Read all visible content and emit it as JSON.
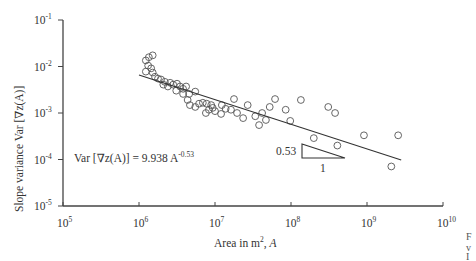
{
  "chart_data": {
    "type": "scatter",
    "title": "",
    "xlabel": "Area in m², A",
    "xlabel_parts": {
      "text": "Area in m",
      "sup": "2",
      "suffix": ", ",
      "var": "A"
    },
    "ylabel": "Slope variance Var [∇z(A)]",
    "xscale": "log",
    "yscale": "log",
    "xlim": [
      100000,
      10000000000
    ],
    "ylim": [
      1e-05,
      0.1
    ],
    "x_ticks": [
      {
        "base": "10",
        "exp": "5",
        "log": 5
      },
      {
        "base": "10",
        "exp": "6",
        "log": 6
      },
      {
        "base": "10",
        "exp": "7",
        "log": 7
      },
      {
        "base": "10",
        "exp": "8",
        "log": 8
      },
      {
        "base": "10",
        "exp": "9",
        "log": 9
      },
      {
        "base": "10",
        "exp": "10",
        "log": 10
      }
    ],
    "y_ticks": [
      {
        "base": "10",
        "exp": "-1",
        "log": -1
      },
      {
        "base": "10",
        "exp": "-2",
        "log": -2
      },
      {
        "base": "10",
        "exp": "-3",
        "log": -3
      },
      {
        "base": "10",
        "exp": "-4",
        "log": -4
      },
      {
        "base": "10",
        "exp": "-5",
        "log": -5
      }
    ],
    "grid": false,
    "legend": null,
    "fit": {
      "equation_text": "Var [∇z(A)] = 9.938 A",
      "equation_exp": "-0.53",
      "coefficient": 9.938,
      "exponent": -0.53,
      "log_x_range": [
        6.0,
        9.45
      ]
    },
    "slope_triangle": {
      "rise_label": "0.53",
      "run_label": "1"
    },
    "series": [
      {
        "name": "observations",
        "marker": "open-circle",
        "points_log10": [
          [
            6.09,
            -1.87
          ],
          [
            6.13,
            -1.8
          ],
          [
            6.18,
            -1.76
          ],
          [
            6.12,
            -1.98
          ],
          [
            6.16,
            -2.04
          ],
          [
            6.09,
            -2.11
          ],
          [
            6.18,
            -2.13
          ],
          [
            6.21,
            -2.22
          ],
          [
            6.25,
            -2.26
          ],
          [
            6.29,
            -2.28
          ],
          [
            6.34,
            -2.33
          ],
          [
            6.32,
            -2.39
          ],
          [
            6.38,
            -2.43
          ],
          [
            6.41,
            -2.35
          ],
          [
            6.45,
            -2.39
          ],
          [
            6.5,
            -2.37
          ],
          [
            6.54,
            -2.43
          ],
          [
            6.58,
            -2.48
          ],
          [
            6.62,
            -2.43
          ],
          [
            6.49,
            -2.52
          ],
          [
            6.58,
            -2.59
          ],
          [
            6.66,
            -2.59
          ],
          [
            6.74,
            -2.54
          ],
          [
            6.64,
            -2.72
          ],
          [
            6.67,
            -2.83
          ],
          [
            6.74,
            -2.87
          ],
          [
            6.79,
            -2.8
          ],
          [
            6.84,
            -2.78
          ],
          [
            6.89,
            -2.8
          ],
          [
            6.95,
            -2.83
          ],
          [
            6.97,
            -2.89
          ],
          [
            7.0,
            -2.96
          ],
          [
            6.92,
            -2.93
          ],
          [
            6.88,
            -3.0
          ],
          [
            7.08,
            -3.02
          ],
          [
            7.14,
            -2.91
          ],
          [
            7.09,
            -2.83
          ],
          [
            7.21,
            -2.93
          ],
          [
            7.29,
            -3.0
          ],
          [
            7.25,
            -2.7
          ],
          [
            7.37,
            -3.11
          ],
          [
            7.43,
            -2.83
          ],
          [
            7.53,
            -3.07
          ],
          [
            7.58,
            -3.26
          ],
          [
            7.62,
            -3.0
          ],
          [
            7.67,
            -3.15
          ],
          [
            7.79,
            -2.7
          ],
          [
            7.72,
            -2.87
          ],
          [
            7.93,
            -2.93
          ],
          [
            7.99,
            -3.17
          ],
          [
            8.13,
            -2.72
          ],
          [
            8.3,
            -3.54
          ],
          [
            8.49,
            -2.87
          ],
          [
            8.58,
            -3.0
          ],
          [
            8.61,
            -3.7
          ],
          [
            8.96,
            -3.48
          ],
          [
            9.41,
            -3.48
          ],
          [
            9.32,
            -4.15
          ]
        ]
      }
    ]
  },
  "page": {
    "cut_text": [
      "F",
      "v",
      "I"
    ]
  }
}
